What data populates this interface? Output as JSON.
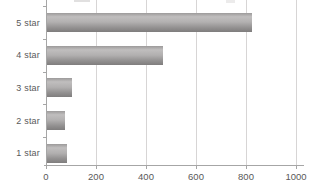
{
  "chart_data": {
    "type": "bar",
    "orientation": "horizontal",
    "title": "",
    "xlabel": "",
    "ylabel": "",
    "categories": [
      "5 star",
      "4 star",
      "3 star",
      "2 star",
      "1 star"
    ],
    "values": [
      820,
      465,
      100,
      70,
      80
    ],
    "xlim": [
      0,
      1000
    ],
    "x_ticks": [
      0,
      200,
      400,
      600,
      800,
      1000
    ],
    "x_tick_labels": [
      "0",
      "200",
      "400",
      "600",
      "800",
      "1000"
    ],
    "grid": true,
    "legend": false,
    "bar_color": "#a6a4a4",
    "gridline_color": "#d7d5d5",
    "axis_color": "#a6a6a6",
    "text_color": "#595959",
    "note": "top of chart (title area) cropped out of frame"
  }
}
